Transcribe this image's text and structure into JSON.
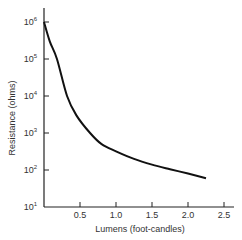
{
  "chart_data": {
    "type": "line",
    "title": "",
    "xlabel": "Lumens (foot-candles)",
    "ylabel": "Resistance (ohms)",
    "x_scale": "linear",
    "y_scale": "log",
    "xlim": [
      0,
      2.6
    ],
    "ylim": [
      10,
      1500000
    ],
    "x_ticks": [
      0.5,
      1.0,
      1.5,
      2.0,
      2.5
    ],
    "x_tick_labels": [
      "0.5",
      "1.0",
      "1.5",
      "2.0",
      "2.5"
    ],
    "y_ticks": [
      10,
      100,
      1000,
      10000,
      100000,
      1000000
    ],
    "y_tick_labels": [
      {
        "base": "10",
        "exp": "1"
      },
      {
        "base": "10",
        "exp": "2"
      },
      {
        "base": "10",
        "exp": "3"
      },
      {
        "base": "10",
        "exp": "4"
      },
      {
        "base": "10",
        "exp": "5"
      },
      {
        "base": "10",
        "exp": "6"
      }
    ],
    "grid": false,
    "legend": null,
    "series": [
      {
        "name": "Photoresistor response",
        "color": "#111111",
        "x": [
          0.0,
          0.08,
          0.18,
          0.32,
          0.45,
          0.64,
          0.8,
          1.0,
          1.25,
          1.5,
          1.75,
          2.0,
          2.25
        ],
        "y": [
          1000000,
          300000,
          100000,
          10000,
          3000,
          1000,
          500,
          320,
          200,
          140,
          105,
          80,
          60
        ]
      }
    ]
  }
}
